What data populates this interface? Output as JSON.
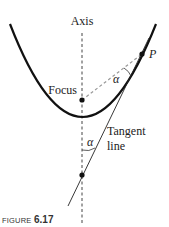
{
  "figure": {
    "caption_prefix": "FIGURE",
    "caption_number": "6.17"
  },
  "labels": {
    "axis": "Axis",
    "focus": "Focus",
    "point": "P",
    "angle_top": "α",
    "angle_bottom": "α",
    "tangent_line_1": "Tangent",
    "tangent_line_2": "line"
  },
  "colors": {
    "stroke": "#111111",
    "dashed": "#555555",
    "dashed_light": "#999999",
    "caption": "#333333"
  }
}
